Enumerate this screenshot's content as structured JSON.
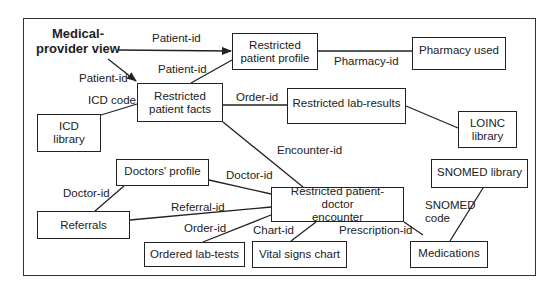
{
  "title": {
    "line1": "Medical-",
    "line2": "provider view"
  },
  "boxes": {
    "patient_profile": {
      "line1": "Restricted",
      "line2": "patient profile"
    },
    "pharmacy_used": {
      "label": "Pharmacy used"
    },
    "patient_facts": {
      "line1": "Restricted",
      "line2": "patient facts"
    },
    "lab_results": {
      "label": "Restricted lab-results"
    },
    "loinc_library": {
      "line1": "LOINC",
      "line2": "library"
    },
    "icd_library": {
      "line1": "ICD",
      "line2": "library"
    },
    "doctors_profile": {
      "label": "Doctors' profile"
    },
    "referrals": {
      "label": "Referrals"
    },
    "encounter": {
      "line1": "Restricted patient-doctor",
      "line2": "encounter"
    },
    "ordered_lab_tests": {
      "label": "Ordered lab-tests"
    },
    "vital_signs_chart": {
      "label": "Vital signs chart"
    },
    "snomed_library": {
      "label": "SNOMED library"
    },
    "medications": {
      "label": "Medications"
    }
  },
  "edge_labels": {
    "view_to_profile": "Patient-id",
    "view_to_facts": "Patient-id",
    "facts_to_profile": "Patient-id",
    "profile_to_pharmacy": "Pharmacy-id",
    "facts_to_icd": "ICD code",
    "facts_to_lab": "Order-id",
    "facts_to_encounter": "Encounter-id",
    "doctors_to_encounter": "Doctor-id",
    "doctors_to_referrals": "Doctor-id",
    "referrals_to_encounter": "Referral-id",
    "labtests_to_encounter": "Order-id",
    "vitals_to_encounter": "Chart-id",
    "medications_to_encounter": "Prescription-id",
    "snomed_to_medications_1": "SNOMED",
    "snomed_to_medications_2": "code"
  },
  "colors": {
    "line": "#222222",
    "background": "#ffffff"
  }
}
